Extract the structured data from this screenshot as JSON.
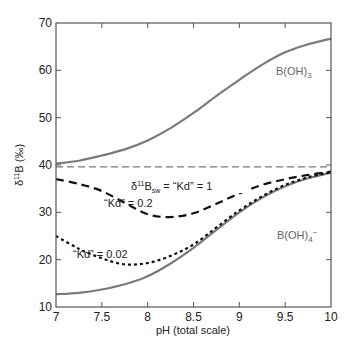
{
  "chart_data": {
    "type": "line",
    "title": "",
    "xlabel": "pH (total scale)",
    "ylabel": "δ11B (‰)",
    "xlim": [
      7,
      10
    ],
    "ylim": [
      10,
      70
    ],
    "xticks": [
      7,
      7.5,
      8,
      8.5,
      9,
      9.5,
      10
    ],
    "xtick_labels": [
      "7",
      "7.5",
      "8",
      "8.5",
      "9",
      "9.5",
      "10"
    ],
    "yticks": [
      10,
      20,
      30,
      40,
      50,
      60,
      70
    ],
    "ytick_labels": [
      "10",
      "20",
      "30",
      "40",
      "50",
      "60",
      "70"
    ],
    "grid": false,
    "legend": "none (inline annotations)",
    "series": [
      {
        "name": "B(OH)3",
        "style": "solid",
        "color": "#7a7a7a",
        "x": [
          7,
          7.25,
          7.5,
          7.75,
          8,
          8.25,
          8.5,
          8.75,
          9,
          9.25,
          9.5,
          9.75,
          10
        ],
        "y": [
          40.3,
          40.9,
          42.0,
          43.3,
          45.2,
          47.8,
          51.0,
          54.6,
          58.0,
          61.2,
          63.8,
          65.5,
          66.7
        ]
      },
      {
        "name": "B(OH)4-",
        "style": "solid",
        "color": "#7a7a7a",
        "x": [
          7,
          7.25,
          7.5,
          7.75,
          8,
          8.25,
          8.5,
          8.75,
          9,
          9.25,
          9.5,
          9.75,
          10
        ],
        "y": [
          12.7,
          13.0,
          13.7,
          14.8,
          16.5,
          19.2,
          22.5,
          26.3,
          30.0,
          33.1,
          35.5,
          37.2,
          38.4
        ]
      },
      {
        "name": "\"Kd\" = 0.2",
        "style": "dashed",
        "color": "#111111",
        "x": [
          7,
          7.25,
          7.5,
          7.75,
          8,
          8.25,
          8.5,
          8.75,
          9,
          9.25,
          9.5,
          9.75,
          10
        ],
        "y": [
          37.0,
          36.0,
          34.5,
          32.0,
          29.6,
          29.0,
          29.8,
          31.8,
          34.0,
          35.8,
          37.0,
          37.9,
          38.6
        ]
      },
      {
        "name": "\"Kd\" = 0.02",
        "style": "dotted",
        "color": "#111111",
        "x": [
          7,
          7.25,
          7.5,
          7.75,
          8,
          8.25,
          8.5,
          8.75,
          9,
          9.25,
          9.5,
          9.75,
          10
        ],
        "y": [
          25.0,
          22.3,
          20.3,
          19.0,
          19.3,
          20.8,
          23.2,
          26.8,
          30.4,
          33.4,
          35.8,
          37.4,
          38.5
        ]
      },
      {
        "name": "δ11Bsw = \"Kd\" = 1",
        "style": "long-dash",
        "color": "#555555",
        "x": [
          7,
          10
        ],
        "y": [
          39.6,
          39.6
        ]
      }
    ],
    "annotations": [
      {
        "text": "B(OH)3",
        "x": 9.6,
        "y": 56
      },
      {
        "text": "δ11Bsw = \"Kd\" = 1",
        "x": 8.1,
        "y": 39.6
      },
      {
        "text": "\"Kd\" = 0.2",
        "x": 7.55,
        "y": 32.5
      },
      {
        "text": "\"Kd\" = 0.02",
        "x": 7.35,
        "y": 22
      },
      {
        "text": "B(OH)4−",
        "x": 9.6,
        "y": 33
      }
    ]
  },
  "labels": {
    "xlabel": "pH (total scale)",
    "ylabel_delta": "δ",
    "ylabel_sup": "11",
    "ylabel_rest": "B (‰)",
    "boh3_main": "B(OH)",
    "boh3_sub": "3",
    "boh4_main": "B(OH)",
    "boh4_sub": "4",
    "boh4_sup": "−",
    "sw_delta": "δ",
    "sw_sup": "11",
    "sw_B": "B",
    "sw_sub": "sw",
    "sw_rest": " = “Kd” = 1",
    "kd02": "“Kd” = 0.2",
    "kd002": "“Kd” = 0.02"
  }
}
